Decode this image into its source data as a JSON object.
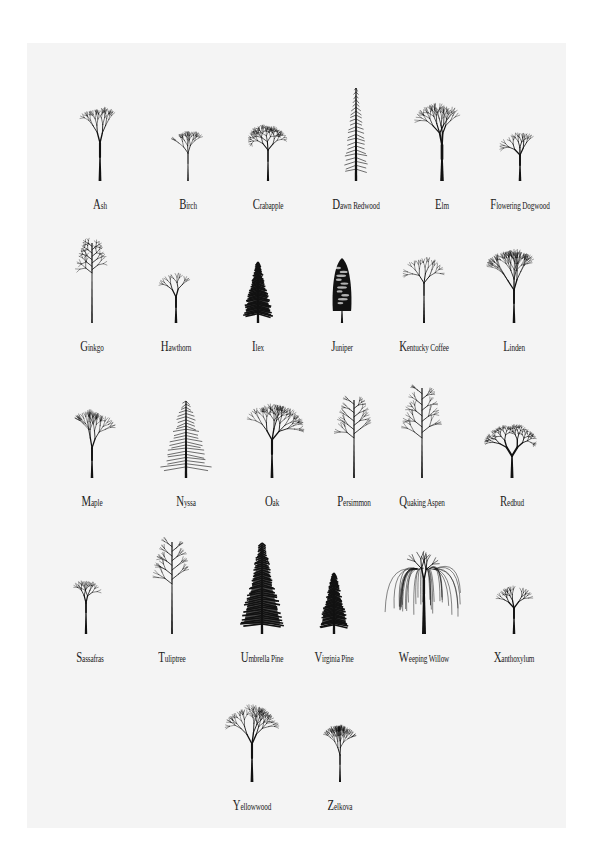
{
  "poster": {
    "background": "#f4f4f4",
    "ink_color": "#111111",
    "trees": [
      {
        "name": "Ash",
        "shape": "round-broad",
        "x": 28,
        "y": 35
      },
      {
        "name": "Birch",
        "shape": "small-open",
        "x": 116,
        "y": 35
      },
      {
        "name": "Crabapple",
        "shape": "spreading-twiggy",
        "x": 196,
        "y": 35
      },
      {
        "name": "Dawn Redwood",
        "shape": "narrow-conifer",
        "x": 284,
        "y": 35
      },
      {
        "name": "Elm",
        "shape": "vase",
        "x": 370,
        "y": 35
      },
      {
        "name": "Flowering Dogwood",
        "shape": "small-round",
        "x": 448,
        "y": 35
      },
      {
        "name": "Ginkgo",
        "shape": "sparse-columnar",
        "x": 20,
        "y": 177
      },
      {
        "name": "Hawthorn",
        "shape": "small-round",
        "x": 104,
        "y": 177
      },
      {
        "name": "Ilex",
        "shape": "dense-conifer-small",
        "x": 186,
        "y": 177
      },
      {
        "name": "Juniper",
        "shape": "dense-columnar",
        "x": 270,
        "y": 177
      },
      {
        "name": "Kentucky Coffee",
        "shape": "open-twiggy",
        "x": 352,
        "y": 177
      },
      {
        "name": "Linden",
        "shape": "broad-pyramid",
        "x": 442,
        "y": 177
      },
      {
        "name": "Maple",
        "shape": "oval-dense",
        "x": 20,
        "y": 332
      },
      {
        "name": "Nyssa",
        "shape": "pyramid-layered",
        "x": 114,
        "y": 332
      },
      {
        "name": "Oak",
        "shape": "round-broad",
        "x": 200,
        "y": 332
      },
      {
        "name": "Persimmon",
        "shape": "narrow-oval",
        "x": 282,
        "y": 332
      },
      {
        "name": "Quaking Aspen",
        "shape": "narrow-open",
        "x": 350,
        "y": 332
      },
      {
        "name": "Redbud",
        "shape": "forked-spreading",
        "x": 440,
        "y": 332
      },
      {
        "name": "Sassafras",
        "shape": "leaning-small",
        "x": 18,
        "y": 488
      },
      {
        "name": "Tuliptree",
        "shape": "tall-narrow",
        "x": 100,
        "y": 488
      },
      {
        "name": "Umbrella Pine",
        "shape": "dense-conifer-tall",
        "x": 190,
        "y": 488
      },
      {
        "name": "Virginia Pine",
        "shape": "dense-conifer-small",
        "x": 262,
        "y": 488
      },
      {
        "name": "Weeping Willow",
        "shape": "weeping",
        "x": 352,
        "y": 488
      },
      {
        "name": "Xanthoxylum",
        "shape": "small-round",
        "x": 442,
        "y": 488
      },
      {
        "name": "Yellowwood",
        "shape": "round-broad",
        "x": 180,
        "y": 636
      },
      {
        "name": "Zelkova",
        "shape": "vase-narrow",
        "x": 268,
        "y": 636
      }
    ]
  }
}
